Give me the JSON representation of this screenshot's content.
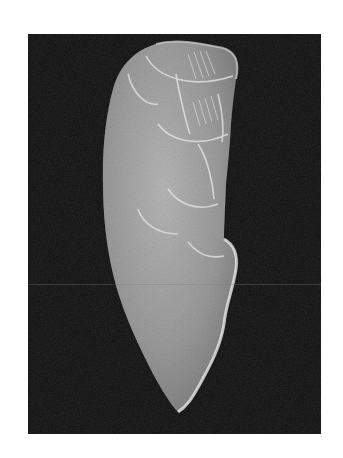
{
  "image": {
    "subject": "engraved stone artifact",
    "style": "black-and-white photograph",
    "background_color": "#0d0d0d",
    "page_color": "#ffffff",
    "object_tone": "#a8a8a8",
    "highlight_tone": "#e6e6e6",
    "frame": {
      "x": 28,
      "y": 34,
      "width": 293,
      "height": 400
    }
  }
}
